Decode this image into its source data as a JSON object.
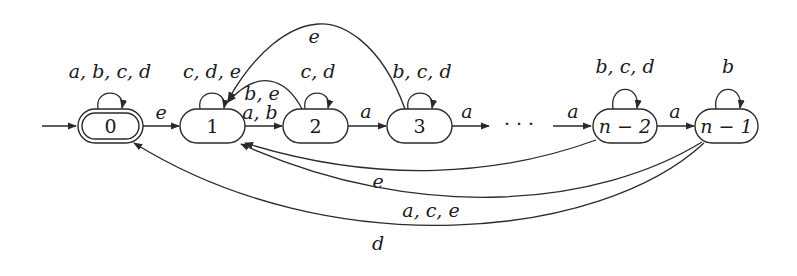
{
  "diagram": {
    "type": "finite-automaton",
    "colors": {
      "stroke": "#2a2a2a",
      "text": "#1a1a1a",
      "background": "#ffffff"
    },
    "states": [
      {
        "id": "0",
        "label": "0",
        "accepting": true,
        "initial": true
      },
      {
        "id": "1",
        "label": "1"
      },
      {
        "id": "2",
        "label": "2"
      },
      {
        "id": "3",
        "label": "3"
      },
      {
        "id": "n-2",
        "label": "n − 2"
      },
      {
        "id": "n-1",
        "label": "n − 1"
      }
    ],
    "ellipsis": "· · ·",
    "transitions": [
      {
        "from": "0",
        "to": "0",
        "label": "a, b, c, d"
      },
      {
        "from": "0",
        "to": "1",
        "label": "e"
      },
      {
        "from": "1",
        "to": "1",
        "label": "c, d, e"
      },
      {
        "from": "1",
        "to": "2",
        "label": "a, b"
      },
      {
        "from": "2",
        "to": "2",
        "label": "c, d"
      },
      {
        "from": "2",
        "to": "1",
        "label": "b, e"
      },
      {
        "from": "2",
        "to": "3",
        "label": "a"
      },
      {
        "from": "3",
        "to": "3",
        "label": "b, c, d"
      },
      {
        "from": "3",
        "to": "1",
        "label": "e"
      },
      {
        "from": "3",
        "to": "…",
        "label": "a"
      },
      {
        "from": "…",
        "to": "n-2",
        "label": "a"
      },
      {
        "from": "n-2",
        "to": "n-2",
        "label": "b, c, d"
      },
      {
        "from": "n-2",
        "to": "n-1",
        "label": "a"
      },
      {
        "from": "n-1",
        "to": "n-1",
        "label": "b"
      },
      {
        "from": "n-2",
        "to": "1",
        "label": "e"
      },
      {
        "from": "n-1",
        "to": "1",
        "label": "a, c, e"
      },
      {
        "from": "n-1",
        "to": "0",
        "label": "d"
      }
    ]
  }
}
